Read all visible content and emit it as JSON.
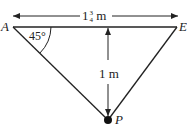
{
  "diagram": {
    "points": {
      "left": {
        "label": "A",
        "x": 12,
        "y": 27
      },
      "right": {
        "label": "E",
        "x": 178,
        "y": 27
      },
      "bottom": {
        "label": "P",
        "x": 108,
        "y": 120
      }
    },
    "width_label": {
      "whole": "1",
      "num": "3",
      "den": "4",
      "unit": "m"
    },
    "height_label": "1 m",
    "angle_label": "45°",
    "colors": {
      "line": "#222222",
      "background": "#ffffff"
    }
  }
}
